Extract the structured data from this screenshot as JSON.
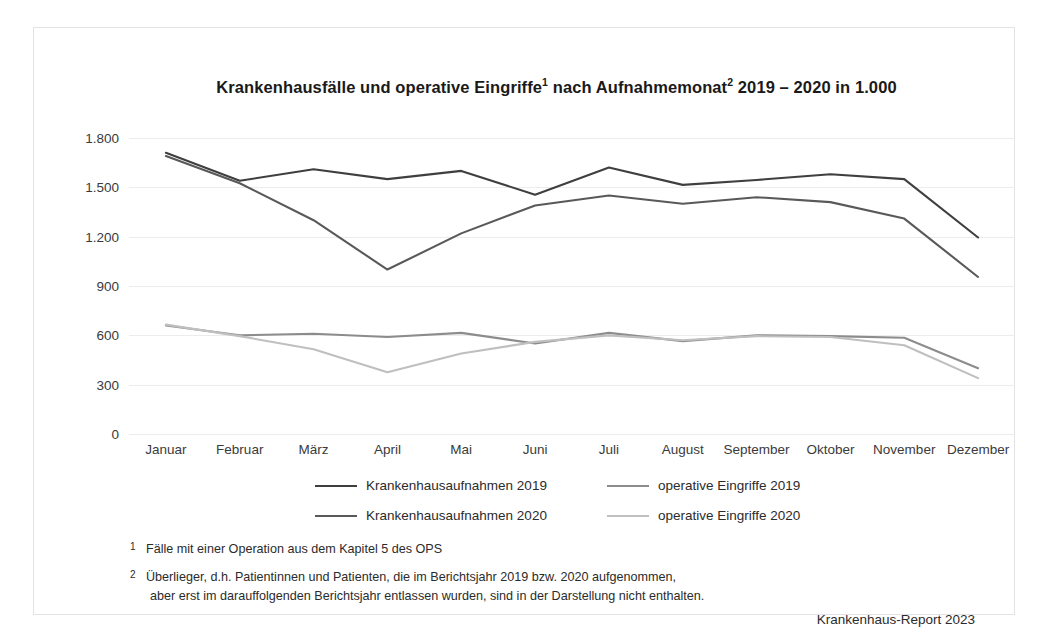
{
  "figure": {
    "title_main": "Krankenhausfälle und operative Eingriffe",
    "title_sup1": "1",
    "title_mid": " nach Aufnahmemonat",
    "title_sup2": "2",
    "title_end": " 2019 – 2020 in 1.000",
    "source": "Krankenhaus-Report 2023",
    "footnote_1_marker": "1",
    "footnote_1_text": "Fälle mit einer Operation aus dem Kapitel 5 des OPS",
    "footnote_2_marker": "2",
    "footnote_2_line1": "Überlieger, d.h. Patientinnen und Patienten, die im Berichtsjahr 2019 bzw. 2020 aufgenommen,",
    "footnote_2_line2": "aber erst im darauffolgenden Berichtsjahr entlassen wurden, sind in der Darstellung nicht enthalten."
  },
  "colors": {
    "series_1": "#3f3f3f",
    "series_2": "#595959",
    "series_3": "#8c8c8c",
    "series_4": "#bfbfbf",
    "grid": "#ececec",
    "frame": "#e3e3e3",
    "text": "#2b2b2b"
  },
  "chart_data": {
    "type": "line",
    "title": "Krankenhausfälle und operative Eingriffe1 nach Aufnahmemonat2 2019 – 2020 in 1.000",
    "xlabel": "",
    "ylabel": "",
    "ylim": [
      0,
      1800
    ],
    "ytick_labels": [
      "1.800",
      "1.500",
      "1.200",
      "900",
      "600",
      "300",
      "0"
    ],
    "ytick_values": [
      1800,
      1500,
      1200,
      900,
      600,
      300,
      0
    ],
    "grid": true,
    "legend_position": "below-axes",
    "categories": [
      "Januar",
      "Februar",
      "März",
      "April",
      "Mai",
      "Juni",
      "Juli",
      "August",
      "September",
      "Oktober",
      "November",
      "Dezember"
    ],
    "series": [
      {
        "name": "Krankenhausaufnahmen 2019",
        "color": "#3f3f3f",
        "values": [
          1710,
          1540,
          1610,
          1550,
          1600,
          1455,
          1620,
          1515,
          1545,
          1580,
          1550,
          1195
        ]
      },
      {
        "name": "Krankenhausaufnahmen 2020",
        "color": "#595959",
        "values": [
          1690,
          1525,
          1300,
          1000,
          1220,
          1390,
          1450,
          1400,
          1440,
          1410,
          1310,
          955
        ]
      },
      {
        "name": "operative Eingriffe 2019",
        "color": "#8c8c8c",
        "values": [
          660,
          600,
          610,
          590,
          615,
          550,
          615,
          565,
          600,
          595,
          585,
          400
        ]
      },
      {
        "name": "operative Eingriffe 2020",
        "color": "#bfbfbf",
        "values": [
          665,
          595,
          515,
          375,
          490,
          560,
          600,
          570,
          595,
          590,
          540,
          340
        ]
      }
    ]
  }
}
